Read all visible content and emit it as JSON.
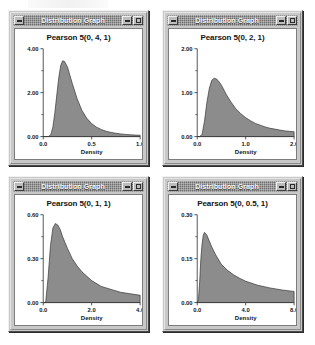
{
  "window": {
    "title": "Distribution Graph",
    "buttons": {
      "system_menu": "system-menu",
      "minimize": "minimize",
      "maximize": "maximize"
    }
  },
  "charts": [
    {
      "window_title": "Distribution Graph",
      "chart_data": {
        "type": "area",
        "title": "Pearson 5(0, 4, 1)",
        "xlabel": "Density",
        "ylabel": "",
        "xlim": [
          0.0,
          1.0
        ],
        "ylim": [
          0.0,
          4.0
        ],
        "xticks": [
          "0.0",
          "0.5",
          "1.0"
        ],
        "xtick_values": [
          0.0,
          0.5,
          1.0
        ],
        "yticks": [
          "0.00",
          "2.00",
          "4.00"
        ],
        "ytick_values": [
          0.0,
          2.0,
          4.0
        ],
        "grid": false,
        "legend": "none",
        "distribution": "Pearson Type V (inverse gamma)",
        "params": {
          "location": 0,
          "shape_alpha": 4,
          "scale_beta": 1
        },
        "mode": 0.2,
        "peak_value": 3.45,
        "x": [
          0.0,
          0.02,
          0.04,
          0.06,
          0.08,
          0.1,
          0.12,
          0.14,
          0.16,
          0.18,
          0.2,
          0.22,
          0.25,
          0.3,
          0.35,
          0.4,
          0.45,
          0.5,
          0.55,
          0.6,
          0.65,
          0.7,
          0.75,
          0.8,
          0.85,
          0.9,
          0.95,
          1.0
        ],
        "y": [
          0.0,
          0.0,
          0.0,
          0.01,
          0.11,
          0.45,
          1.09,
          1.89,
          2.67,
          3.23,
          3.45,
          3.42,
          3.17,
          2.42,
          1.72,
          1.19,
          0.83,
          0.59,
          0.43,
          0.32,
          0.24,
          0.19,
          0.15,
          0.12,
          0.1,
          0.08,
          0.07,
          0.06
        ]
      }
    },
    {
      "window_title": "Distribution Graph",
      "chart_data": {
        "type": "area",
        "title": "Pearson 5(0, 2, 1)",
        "xlabel": "Density",
        "ylabel": "",
        "xlim": [
          0.0,
          2.0
        ],
        "ylim": [
          0.0,
          2.0
        ],
        "xticks": [
          "0.0",
          "1.0",
          "2.0"
        ],
        "xtick_values": [
          0.0,
          1.0,
          2.0
        ],
        "yticks": [
          "0.00",
          "1.00",
          "2.00"
        ],
        "ytick_values": [
          0.0,
          1.0,
          2.0
        ],
        "grid": false,
        "legend": "none",
        "distribution": "Pearson Type V (inverse gamma)",
        "params": {
          "location": 0,
          "shape_alpha": 2,
          "scale_beta": 1
        },
        "mode": 0.333,
        "peak_value": 1.33,
        "x": [
          0.0,
          0.05,
          0.1,
          0.15,
          0.2,
          0.25,
          0.3,
          0.35,
          0.4,
          0.45,
          0.5,
          0.6,
          0.7,
          0.8,
          0.9,
          1.0,
          1.1,
          1.2,
          1.3,
          1.4,
          1.5,
          1.6,
          1.7,
          1.8,
          1.9,
          2.0
        ],
        "y": [
          0.0,
          0.0,
          0.05,
          0.35,
          0.78,
          1.1,
          1.28,
          1.33,
          1.31,
          1.25,
          1.17,
          0.96,
          0.78,
          0.63,
          0.52,
          0.43,
          0.36,
          0.3,
          0.26,
          0.22,
          0.19,
          0.17,
          0.15,
          0.13,
          0.12,
          0.11
        ]
      }
    },
    {
      "window_title": "Distribution Graph",
      "chart_data": {
        "type": "area",
        "title": "Pearson 5(0, 1, 1)",
        "xlabel": "Density",
        "ylabel": "",
        "xlim": [
          0.0,
          4.0
        ],
        "ylim": [
          0.0,
          0.6
        ],
        "xticks": [
          "0.0",
          "2.0",
          "4.0"
        ],
        "xtick_values": [
          0.0,
          2.0,
          4.0
        ],
        "yticks": [
          "0.00",
          "0.30",
          "0.60"
        ],
        "ytick_values": [
          0.0,
          0.3,
          0.6
        ],
        "grid": false,
        "legend": "none",
        "distribution": "Pearson Type V (inverse gamma)",
        "params": {
          "location": 0,
          "shape_alpha": 1,
          "scale_beta": 1
        },
        "mode": 0.5,
        "peak_value": 0.54,
        "x": [
          0.0,
          0.1,
          0.2,
          0.3,
          0.4,
          0.5,
          0.6,
          0.7,
          0.8,
          0.9,
          1.0,
          1.2,
          1.4,
          1.6,
          1.8,
          2.0,
          2.4,
          2.8,
          3.2,
          3.6,
          4.0
        ],
        "y": [
          0.0,
          0.0,
          0.17,
          0.39,
          0.51,
          0.54,
          0.53,
          0.5,
          0.45,
          0.41,
          0.37,
          0.3,
          0.25,
          0.21,
          0.18,
          0.15,
          0.11,
          0.09,
          0.07,
          0.06,
          0.05
        ]
      }
    },
    {
      "window_title": "Distribution Graph",
      "chart_data": {
        "type": "area",
        "title": "Pearson 5(0, 0.5, 1)",
        "xlabel": "Density",
        "ylabel": "",
        "xlim": [
          0.0,
          8.0
        ],
        "ylim": [
          0.0,
          0.3
        ],
        "xticks": [
          "0.0",
          "4.0",
          "8.0"
        ],
        "xtick_values": [
          0.0,
          4.0,
          8.0
        ],
        "yticks": [
          "0.00",
          "0.15",
          "0.30"
        ],
        "ytick_values": [
          0.0,
          0.15,
          0.3
        ],
        "grid": false,
        "legend": "none",
        "distribution": "Pearson Type V (inverse gamma)",
        "params": {
          "location": 0,
          "shape_alpha": 0.5,
          "scale_beta": 1
        },
        "mode": 0.667,
        "peak_value": 0.24,
        "x": [
          0.0,
          0.1,
          0.2,
          0.3,
          0.4,
          0.5,
          0.6,
          0.7,
          0.8,
          1.0,
          1.2,
          1.5,
          2.0,
          2.5,
          3.0,
          3.5,
          4.0,
          5.0,
          6.0,
          7.0,
          8.0
        ],
        "y": [
          0.0,
          0.01,
          0.07,
          0.15,
          0.2,
          0.23,
          0.24,
          0.235,
          0.23,
          0.21,
          0.19,
          0.165,
          0.13,
          0.11,
          0.095,
          0.083,
          0.073,
          0.059,
          0.05,
          0.043,
          0.038
        ]
      }
    }
  ],
  "colors": {
    "curve_fill": "#8c8c8c",
    "curve_stroke": "#2e2e2e",
    "axis": "#3a3a3a",
    "plot_bg": "#ffffff",
    "window_face": "#c8c8c8",
    "titlebar": "#6e6e6e",
    "titlebar_text": "#f6f6f6",
    "text": "#141414"
  }
}
